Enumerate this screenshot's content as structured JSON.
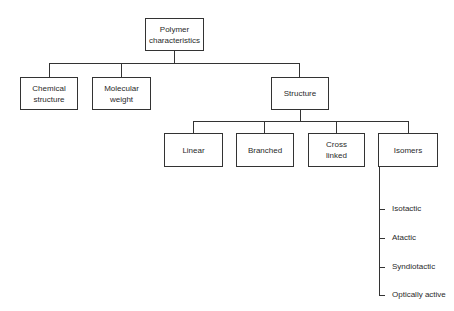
{
  "diagram": {
    "type": "tree",
    "root": {
      "label_line1": "Polymer",
      "label_line2": "characteristics"
    },
    "level1": [
      {
        "label_line1": "Chemical",
        "label_line2": "structure"
      },
      {
        "label_line1": "Molecular",
        "label_line2": "weight"
      },
      {
        "label_line1": "Structure",
        "label_line2": ""
      }
    ],
    "level2": [
      {
        "label_line1": "Linear",
        "label_line2": ""
      },
      {
        "label_line1": "Branched",
        "label_line2": ""
      },
      {
        "label_line1": "Cross",
        "label_line2": "linked"
      },
      {
        "label_line1": "Isomers",
        "label_line2": ""
      }
    ],
    "isomer_types": [
      {
        "label": "Isotactic"
      },
      {
        "label": "Atactic"
      },
      {
        "label": "Syndiotactic"
      },
      {
        "label": "Optically active"
      }
    ]
  },
  "colors": {
    "line": "#333333",
    "background": "#ffffff",
    "text": "#2a2a2a"
  }
}
